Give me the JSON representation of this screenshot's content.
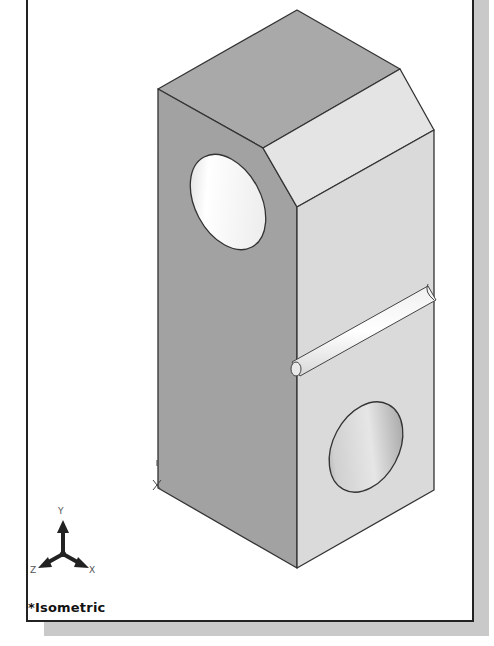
{
  "viewport": {
    "view_name": "*Isometric",
    "background": "#ffffff",
    "border_color": "#222222",
    "shadow_color": "#c9c9c9"
  },
  "model": {
    "type": "rectangular block with chamfered top edge, two through-holes and a horizontal groove",
    "face_colors": {
      "top": "#a9a9a9",
      "left": "#a2a2a2",
      "chamfer": "#e4e4e4",
      "right": "#dadada",
      "edge": "#333333"
    }
  },
  "triad": {
    "x_label": "X",
    "y_label": "Y",
    "z_label": "Z",
    "icon": "coordinate-triad-icon"
  },
  "origin_marker": {
    "icon": "origin-marker-icon"
  }
}
